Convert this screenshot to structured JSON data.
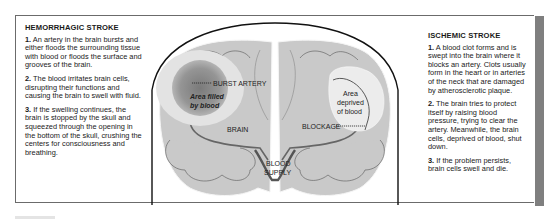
{
  "hemorrhagic": {
    "title": "HEMORRHAGIC STROKE",
    "steps": [
      {
        "num": "1.",
        "text": " An artery in the brain bursts and either floods the surrounding tissue with blood or floods the surface and grooves of the brain."
      },
      {
        "num": "2.",
        "text": " The blood irritates brain cells, disrupting their functions and causing the brain to swell with fluid."
      },
      {
        "num": "3.",
        "text": " If the swelling continues, the brain is stopped by the skull and squeezed through the opening in the bottom of the skull, crushing the centers for consciousness and breathing."
      }
    ]
  },
  "ischemic": {
    "title": "ISCHEMIC STROKE",
    "steps": [
      {
        "num": "1.",
        "text": " A blood clot forms and is swept into the brain where it blocks an artery. Clots usually form in the heart or in arteries of the neck that are damaged by atherosclerotic plaque."
      },
      {
        "num": "2.",
        "text": " The brain tries to protect itself by raising blood pressure, trying to clear the artery. Meanwhile, the brain cells, deprived of blood, shut down."
      },
      {
        "num": "3.",
        "text": " If the problem persists, brain cells swell and die."
      }
    ]
  },
  "diagram": {
    "burst_artery": "BURST ARTERY",
    "area_filled_1": "Area filled",
    "area_filled_2": "by blood",
    "brain": "BRAIN",
    "area_deprived_1": "Area",
    "area_deprived_2": "deprived",
    "area_deprived_3": "of blood",
    "blockage": "BLOCKAGE",
    "blood_1": "BLOOD",
    "blood_2": "SUPPLY"
  },
  "colors": {
    "brain_fill": "#c9c9c9",
    "bleed_dark": "#8a8a8a",
    "deprived_light": "#e6e6e6",
    "frame_border": "#6b6b6b",
    "side_strip": "#7f7f7f"
  }
}
